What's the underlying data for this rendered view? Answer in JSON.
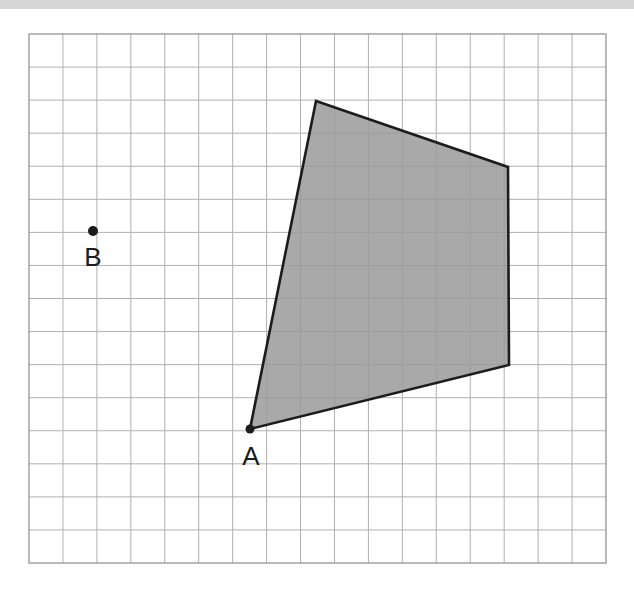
{
  "figure": {
    "background_color": "#ffffff",
    "top_bar": {
      "name": "top-gray-bar",
      "color": "#d6d6d6",
      "x": 0,
      "y": 0,
      "width": 634,
      "height": 9
    }
  },
  "grid": {
    "x": 29,
    "y": 34,
    "width": 577,
    "height": 529,
    "columns": 17,
    "rows": 16,
    "cell_width": 33.94,
    "cell_height": 33.06,
    "line_color": "#b0b0b0",
    "border_color": "#9c9c9c",
    "line_width": 1
  },
  "chart_data": {
    "type": "scatter",
    "xlabel": "",
    "ylabel": "",
    "grid": true,
    "legend": null,
    "axis_units": "grid cells",
    "grid_origin_px": {
      "x": 29,
      "y": 34
    },
    "grid_cell_px": {
      "w": 33.94,
      "h": 33.06
    },
    "shapes": [
      {
        "name": "shaded-quadrilateral",
        "type": "polygon",
        "fill": "#9a9a9a",
        "fill_opacity": 0.85,
        "stroke": "#1c1c1c",
        "stroke_width": 2.6,
        "vertices_px": [
          {
            "x": 316,
            "y": 101
          },
          {
            "x": 508,
            "y": 167
          },
          {
            "x": 509,
            "y": 365
          },
          {
            "x": 250,
            "y": 429
          }
        ],
        "vertices_grid": [
          {
            "col": 8.46,
            "row": 2.03
          },
          {
            "col": 14.11,
            "row": 4.02
          },
          {
            "col": 14.14,
            "row": 10.01
          },
          {
            "col": 6.51,
            "row": 11.95
          }
        ]
      }
    ],
    "points": [
      {
        "label": "A",
        "x_px": 250,
        "y_px": 429,
        "col": 6.51,
        "row": 11.95,
        "radius": 4.5,
        "color": "#1c1c1c",
        "label_x_px": 251,
        "label_y_px": 458
      },
      {
        "label": "B",
        "x_px": 93,
        "y_px": 231,
        "col": 1.89,
        "row": 5.96,
        "radius": 5,
        "color": "#1c1c1c",
        "label_x_px": 93,
        "label_y_px": 259
      }
    ]
  },
  "colors": {
    "shape_fill": "#9a9a9a",
    "shape_stroke": "#1c1c1c",
    "grid_line": "#b0b0b0",
    "grid_border": "#9c9c9c",
    "point": "#1c1c1c",
    "top_bar": "#d6d6d6",
    "page_background": "#ffffff"
  }
}
